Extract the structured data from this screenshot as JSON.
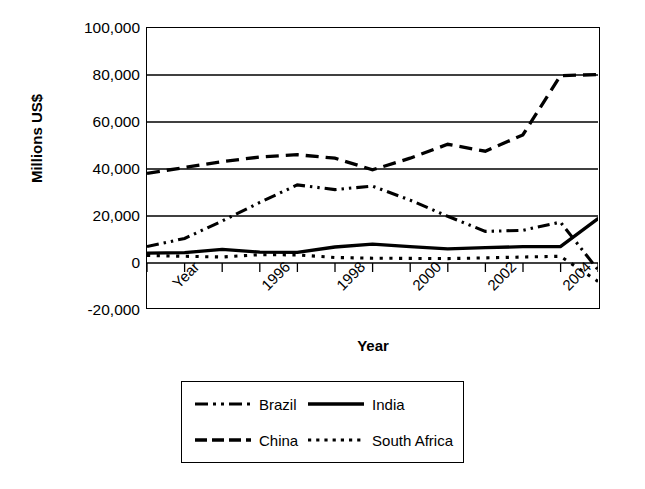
{
  "chart_data": {
    "type": "line",
    "title": "",
    "xlabel": "Year",
    "ylabel": "Millions US$",
    "ylim": [
      -20000,
      100000
    ],
    "ytick_labels": [
      "100,000",
      "80,000",
      "60,000",
      "40,000",
      "20,000",
      "0",
      "-20,000"
    ],
    "ytick_values": [
      100000,
      80000,
      60000,
      40000,
      20000,
      0,
      -20000
    ],
    "grid": "horizontal",
    "legend_position": "below-plot",
    "x_axis_origin_label": "Year",
    "xtick_labels": [
      "Year",
      "1996",
      "1998",
      "2000",
      "2002",
      "2004"
    ],
    "xtick_values": [
      1994,
      1996,
      1998,
      2000,
      2002,
      2004
    ],
    "x": [
      1994,
      1995,
      1996,
      1997,
      1998,
      1999,
      2000,
      2001,
      2002,
      2003,
      2004,
      2005,
      2006
    ],
    "series": [
      {
        "name": "Brazil",
        "style": "dash-dot-dot",
        "values": [
          6000,
          9500,
          17000,
          25000,
          32500,
          30500,
          32000,
          26000,
          19000,
          12500,
          13000,
          16500,
          -4000
        ]
      },
      {
        "name": "China",
        "style": "long-dash",
        "values": [
          37500,
          40000,
          42500,
          44500,
          45500,
          44000,
          39000,
          44000,
          50000,
          47000,
          54000,
          79500,
          80000
        ]
      },
      {
        "name": "India",
        "style": "solid",
        "values": [
          3200,
          3400,
          4800,
          3600,
          3500,
          5800,
          7000,
          6000,
          5000,
          5500,
          6000,
          6000,
          18000
        ]
      },
      {
        "name": "South Africa",
        "style": "dotted",
        "values": [
          2200,
          1800,
          1500,
          2500,
          2400,
          1300,
          1000,
          900,
          800,
          1100,
          1500,
          1800,
          -9000
        ]
      }
    ]
  },
  "axes": {
    "ylabel": "Millions US$",
    "xlabel": "Year",
    "yticks": [
      {
        "label": "100,000"
      },
      {
        "label": "80,000"
      },
      {
        "label": "60,000"
      },
      {
        "label": "40,000"
      },
      {
        "label": "20,000"
      },
      {
        "label": "0"
      },
      {
        "label": "-20,000"
      }
    ],
    "xticks": [
      {
        "label": "Year"
      },
      {
        "label": "1996"
      },
      {
        "label": "1998"
      },
      {
        "label": "2000"
      },
      {
        "label": "2002"
      },
      {
        "label": "2004"
      }
    ]
  },
  "legend": {
    "entries": [
      {
        "label": "Brazil",
        "style": "dash-dot-dot"
      },
      {
        "label": "India",
        "style": "solid"
      },
      {
        "label": "China",
        "style": "long-dash"
      },
      {
        "label": "South Africa",
        "style": "dotted"
      }
    ]
  },
  "colors": {
    "line": "#000000",
    "grid": "#000000",
    "background": "#ffffff"
  }
}
